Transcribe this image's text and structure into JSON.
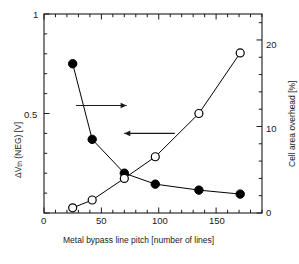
{
  "chart_data": {
    "type": "scatter",
    "title": "",
    "subtitle": "",
    "xlabel": "Metal bypass line pitch [number of lines]",
    "ylabel_left": "ΔV",
    "ylabel_left_sub": "th",
    "ylabel_left_rest": " (NEG) [V]",
    "ylabel_left_full": "ΔVth (NEG) [V]",
    "ylabel_right": "Cell area overhead [%]",
    "xlim": [
      0,
      190
    ],
    "ylim_left": [
      0,
      1
    ],
    "ylim_right": [
      0,
      23
    ],
    "xticks": [
      0,
      50,
      100,
      150
    ],
    "xticklabels": [
      "0",
      "50",
      "100",
      "150"
    ],
    "yticks_left": [
      0,
      0.5,
      1
    ],
    "yticklabels_left": [
      "",
      "0.5",
      "1"
    ],
    "yticks_right": [
      0,
      10,
      20
    ],
    "yticklabels_right": [
      "0",
      "10",
      "20"
    ],
    "x_minor_interval": 10,
    "y_left_minor_interval": 0.1,
    "y_right_minor_interval": 2,
    "grid": false,
    "legend": "none",
    "series": [
      {
        "name": "ΔVth (NEG) [V]",
        "axis": "left",
        "marker": "filled-circle",
        "color": "#000000",
        "x": [
          25,
          42,
          70,
          97,
          135,
          171
        ],
        "values": [
          0.75,
          0.37,
          0.2,
          0.145,
          0.115,
          0.095
        ]
      },
      {
        "name": "Cell area overhead [%]",
        "axis": "right",
        "marker": "open-circle",
        "color": "#000000",
        "x": [
          25,
          42,
          70,
          97,
          135,
          171
        ],
        "values": [
          0.6,
          1.5,
          4.0,
          6.5,
          11.5,
          18.5
        ]
      }
    ],
    "annotations": [
      {
        "name": "arrow-to-right-axis",
        "type": "arrow",
        "direction": "right",
        "x_start": 28,
        "x_end": 72,
        "y_left_value": 0.54
      },
      {
        "name": "arrow-to-left-axis",
        "type": "arrow",
        "direction": "left",
        "x_start": 114,
        "x_end": 70,
        "y_left_value": 0.4
      }
    ]
  }
}
